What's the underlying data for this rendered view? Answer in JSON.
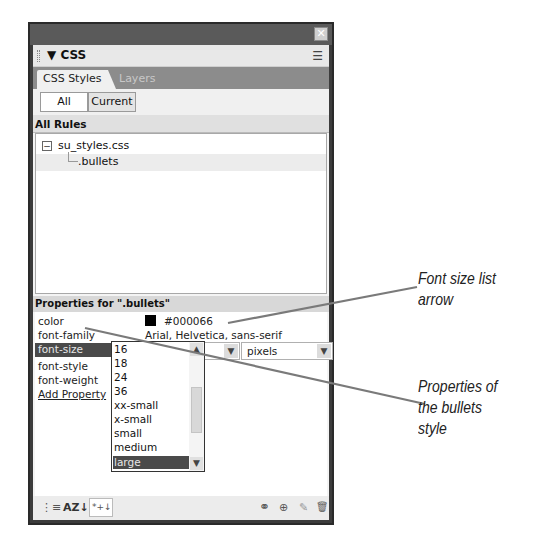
{
  "panel": {
    "close_glyph": "✕",
    "title": "▼ CSS",
    "options_glyph": "☰",
    "tabs": [
      {
        "label": "CSS Styles",
        "active": true
      },
      {
        "label": "Layers",
        "active": false
      }
    ],
    "toggle": {
      "all_label": "All",
      "current_label": "Current",
      "selected": "All"
    },
    "all_rules": {
      "header": "All Rules",
      "tree": [
        {
          "label": "su_styles.css",
          "expander": "−"
        },
        {
          "label": ".bullets"
        }
      ]
    },
    "properties": {
      "header": "Properties for \".bullets\"",
      "rows": [
        {
          "name": "color",
          "value": "#000066",
          "swatch_color": "#000000"
        },
        {
          "name": "font-family",
          "value": "Arial, Helvetica, sans-serif"
        },
        {
          "name": "font-size",
          "value": "16",
          "unit": "pixels",
          "selected": true
        },
        {
          "name": "font-style",
          "value": ""
        },
        {
          "name": "font-weight",
          "value": ""
        },
        {
          "name": "Add Property",
          "link": true
        }
      ]
    },
    "font_size_dropdown": {
      "options": [
        "16",
        "18",
        "24",
        "36",
        "xx-small",
        "x-small",
        "small",
        "medium",
        "large"
      ],
      "highlighted": "large"
    },
    "bottom_toolbar": {
      "left": [
        {
          "icon": "category-view-icon",
          "glyph": "⋮≡"
        },
        {
          "icon": "alpha-sort-icon",
          "glyph": "AZ↓"
        },
        {
          "icon": "set-properties-icon",
          "glyph": "*+↓"
        }
      ],
      "right": [
        {
          "icon": "attach-stylesheet-icon",
          "glyph": "⚭"
        },
        {
          "icon": "new-rule-icon",
          "glyph": "⊕"
        },
        {
          "icon": "edit-style-icon",
          "glyph": "✎"
        },
        {
          "icon": "delete-icon",
          "glyph": "🗑"
        }
      ]
    }
  },
  "callouts": [
    {
      "text_line1": "Font size list",
      "text_line2": "arrow"
    },
    {
      "text_line1": "Properties of",
      "text_line2": "the bullets",
      "text_line3": "style"
    }
  ],
  "colors": {
    "panel_frame": "#3c3c3c",
    "titlebar": "#5a5a5a",
    "tabbar": "#8c8c8c",
    "selection": "#4a4a4a",
    "callout_line": "#7a7a7a"
  }
}
